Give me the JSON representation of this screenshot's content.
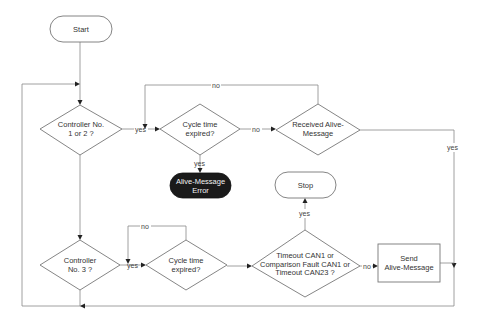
{
  "diagram": {
    "type": "flowchart",
    "nodes": {
      "start": {
        "label": "Start",
        "shape": "terminator"
      },
      "controller12": {
        "line1": "Controller No.",
        "line2": "1 or 2 ?",
        "shape": "decision"
      },
      "cycle1": {
        "line1": "Cycle time",
        "line2": "expired?",
        "shape": "decision"
      },
      "received": {
        "line1": "Received Alive-",
        "line2": "Message",
        "shape": "decision"
      },
      "error": {
        "line1": "Alive-Message",
        "line2": "Error",
        "shape": "terminator",
        "fill": "#1a1a1a"
      },
      "stop": {
        "label": "Stop",
        "shape": "terminator"
      },
      "controller3": {
        "line1": "Controller",
        "line2": "No. 3 ?",
        "shape": "decision"
      },
      "cycle2": {
        "line1": "Cycle time",
        "line2": "expired?",
        "shape": "decision"
      },
      "timeout": {
        "line1": "Timeout CAN1 or",
        "line2": "Comparison Fault CAN1 or",
        "line3": "Timeout CAN23 ?",
        "shape": "decision"
      },
      "send": {
        "line1": "Send",
        "line2": "Alive-Message",
        "shape": "process"
      }
    },
    "edge_labels": {
      "c12_yes": "yes",
      "cycle1_no": "no",
      "received_no": "no",
      "cycle1_yes": "yes",
      "received_yes": "yes",
      "timeout_yes": "yes",
      "c3_yes": "yes",
      "cycle2_no": "no",
      "timeout_no": "no"
    },
    "colors": {
      "line": "#888888",
      "shape_border": "#777777",
      "error_fill": "#1a1a1a",
      "background": "#ffffff"
    }
  }
}
